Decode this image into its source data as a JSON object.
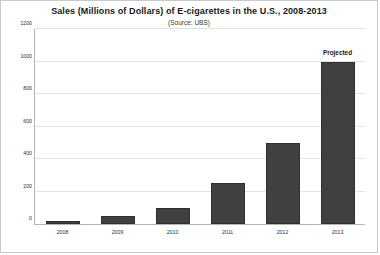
{
  "chart_data": {
    "type": "bar",
    "title": "Sales (Millions of Dollars) of E-cigarettes in the U.S., 2008-2013",
    "subtitle": "(Source: UBS)",
    "xlabel": "",
    "ylabel": "",
    "categories": [
      "2008",
      "2009",
      "2010",
      "2011",
      "2012",
      "2013"
    ],
    "values": [
      20,
      50,
      100,
      250,
      500,
      1000
    ],
    "ylim": [
      0,
      1200
    ],
    "ytick_labels": [
      "0",
      "200",
      "400",
      "600",
      "800",
      "1000",
      "1200"
    ],
    "ytick_values": [
      0,
      200,
      400,
      600,
      800,
      1000,
      1200
    ],
    "grid": true,
    "legend": "none",
    "bar_color": "#404040",
    "gridline_color": "#e3e3e3",
    "axis_color": "#b5b5b5",
    "frame_color": "#c9c9c9",
    "annotations": [
      {
        "text": "Projected",
        "category": "2013",
        "value": 1000
      }
    ]
  }
}
